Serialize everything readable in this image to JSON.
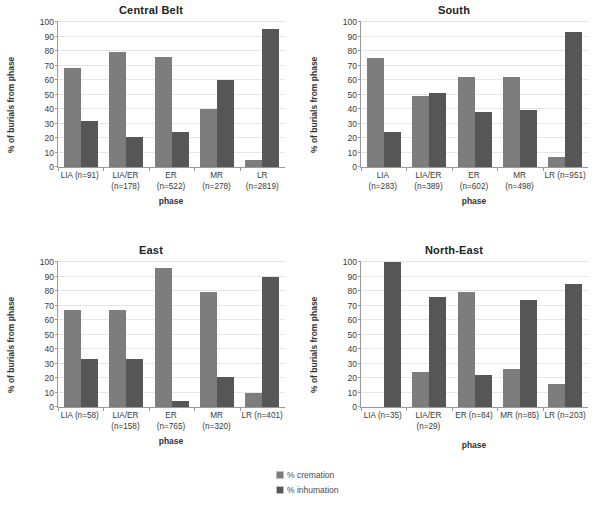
{
  "legend": {
    "position": "bottom-center",
    "items": [
      {
        "label": "% cremation",
        "color": "#7d7d7d",
        "key": "cremation"
      },
      {
        "label": "% inhumation",
        "color": "#565656",
        "key": "inhumation"
      }
    ]
  },
  "common": {
    "ylabel": "% of burials from phase",
    "xlabel": "phase",
    "yticks": [
      0,
      10,
      20,
      30,
      40,
      50,
      60,
      70,
      80,
      90,
      100
    ],
    "ylim": [
      0,
      100
    ]
  },
  "chart_data": [
    {
      "type": "bar",
      "title": "Central Belt",
      "xlabel": "phase",
      "ylabel": "% of burials from phase",
      "ylim": [
        0,
        100
      ],
      "grid": true,
      "legend_position": "bottom-center",
      "categories": [
        "LIA (n=91)",
        "LIA/ER\n(n=178)",
        "ER\n(n=522)",
        "MR\n(n=278)",
        "LR\n(n=2819)"
      ],
      "series": [
        {
          "name": "% cremation",
          "values": [
            68,
            79,
            76,
            40,
            5
          ]
        },
        {
          "name": "% inhumation",
          "values": [
            32,
            21,
            24,
            60,
            95
          ]
        }
      ]
    },
    {
      "type": "bar",
      "title": "South",
      "xlabel": "phase",
      "ylabel": "% of burials from phase",
      "ylim": [
        0,
        100
      ],
      "grid": true,
      "legend_position": "bottom-center",
      "categories": [
        "LIA\n(n=283)",
        "LIA/ER\n(n=389)",
        "ER\n(n=602)",
        "MR\n(n=498)",
        "LR (n=951)"
      ],
      "series": [
        {
          "name": "% cremation",
          "values": [
            75,
            49,
            62,
            62,
            7
          ]
        },
        {
          "name": "% inhumation",
          "values": [
            24,
            51,
            38,
            39,
            93
          ]
        }
      ]
    },
    {
      "type": "bar",
      "title": "East",
      "xlabel": "phase",
      "ylabel": "% of burials from phase",
      "ylim": [
        0,
        100
      ],
      "grid": true,
      "legend_position": "bottom-center",
      "categories": [
        "LIA (n=58)",
        "LIA/ER\n(n=158)",
        "ER\n(n=765)",
        "MR\n(n=320)",
        "LR (n=401)"
      ],
      "series": [
        {
          "name": "% cremation",
          "values": [
            67,
            67,
            96,
            79,
            10
          ]
        },
        {
          "name": "% inhumation",
          "values": [
            33,
            33,
            4,
            21,
            90
          ]
        }
      ]
    },
    {
      "type": "bar",
      "title": "North-East",
      "xlabel": "phase",
      "ylabel": "% of burials from phase",
      "ylim": [
        0,
        100
      ],
      "grid": true,
      "legend_position": "bottom-center",
      "categories": [
        "LIA (n=35)",
        "LIA/ER\n(n=29)",
        "ER (n=84)",
        "MR (n=85)",
        "LR (n=203)"
      ],
      "series": [
        {
          "name": "% cremation",
          "values": [
            0,
            24,
            79,
            26,
            16
          ]
        },
        {
          "name": "% inhumation",
          "values": [
            100,
            76,
            22,
            74,
            85
          ]
        }
      ]
    }
  ]
}
